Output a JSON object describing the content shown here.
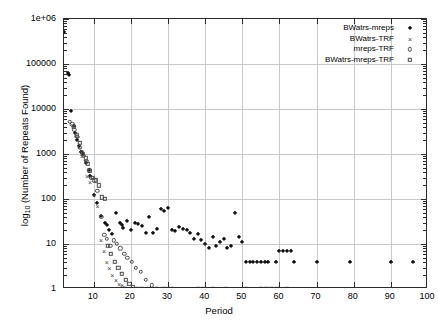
{
  "chart_data": {
    "type": "scatter",
    "title": "",
    "xlabel": "Period",
    "ylabel": "log10 (Number of Repeats Found)",
    "ylabel_base": "log",
    "ylabel_sub": "10",
    "ylabel_rest": " (Number of Repeats Found)",
    "xlim": [
      2,
      100
    ],
    "ylim": [
      1,
      1000000
    ],
    "yscale": "log",
    "xscale": "linear",
    "grid": true,
    "legend_position": "top-right-inside",
    "xticks": [
      10,
      20,
      30,
      40,
      50,
      60,
      70,
      80,
      90,
      100
    ],
    "xticklabels": [
      "10",
      "20",
      "30",
      "40",
      "50",
      "60",
      "70",
      "80",
      "90",
      "100"
    ],
    "yticks": [
      1,
      10,
      100,
      1000,
      10000,
      100000,
      1000000
    ],
    "yticklabels": [
      "1",
      "10",
      "100",
      "1000",
      "10000",
      "100000",
      "1e+06"
    ],
    "series": [
      {
        "name": "BWatrs-mreps",
        "marker": "filled-diamond",
        "color": "#111111",
        "points": [
          [
            2,
            520000
          ],
          [
            3,
            62000
          ],
          [
            3.4,
            58000
          ],
          [
            4,
            9000
          ],
          [
            4.6,
            4200
          ],
          [
            5,
            3000
          ],
          [
            5.4,
            2000
          ],
          [
            6,
            1500
          ],
          [
            6.6,
            1100
          ],
          [
            7,
            1000
          ],
          [
            8,
            620
          ],
          [
            8.6,
            430
          ],
          [
            9,
            330
          ],
          [
            10,
            120
          ],
          [
            11,
            80
          ],
          [
            12,
            42
          ],
          [
            13,
            30
          ],
          [
            13.6,
            26
          ],
          [
            14,
            20
          ],
          [
            15,
            17
          ],
          [
            16,
            48
          ],
          [
            17,
            30
          ],
          [
            17.6,
            26
          ],
          [
            18,
            23
          ],
          [
            19,
            32
          ],
          [
            20,
            20
          ],
          [
            21,
            30
          ],
          [
            22,
            28
          ],
          [
            23,
            25
          ],
          [
            24,
            18
          ],
          [
            25,
            40
          ],
          [
            26,
            18
          ],
          [
            27,
            22
          ],
          [
            28,
            60
          ],
          [
            29,
            55
          ],
          [
            30,
            62
          ],
          [
            31,
            21
          ],
          [
            32,
            19
          ],
          [
            33,
            24
          ],
          [
            34,
            22
          ],
          [
            35,
            20
          ],
          [
            36,
            18
          ],
          [
            37,
            13
          ],
          [
            38,
            17
          ],
          [
            39,
            12
          ],
          [
            40,
            10
          ],
          [
            41,
            8
          ],
          [
            42,
            14
          ],
          [
            43,
            9
          ],
          [
            44,
            11
          ],
          [
            45,
            13
          ],
          [
            46,
            8
          ],
          [
            47,
            9
          ],
          [
            48,
            50
          ],
          [
            49,
            14
          ],
          [
            50,
            11
          ],
          [
            51,
            4
          ],
          [
            52,
            4
          ],
          [
            53,
            4
          ],
          [
            54,
            4
          ],
          [
            55,
            4
          ],
          [
            56,
            4
          ],
          [
            57,
            4
          ],
          [
            59,
            4
          ],
          [
            60,
            7
          ],
          [
            61,
            7
          ],
          [
            62,
            7
          ],
          [
            63,
            7
          ],
          [
            64,
            4
          ],
          [
            70,
            4
          ],
          [
            79,
            4
          ],
          [
            90,
            4
          ],
          [
            96,
            4
          ]
        ]
      },
      {
        "name": "BWatrs-TRF",
        "marker": "cross",
        "color": "#3a3a3a",
        "points": [
          [
            4.4,
            4300
          ],
          [
            5.2,
            2600
          ],
          [
            6.1,
            1400
          ],
          [
            6.8,
            900
          ],
          [
            8.2,
            330
          ],
          [
            9.0,
            240
          ],
          [
            10.1,
            120
          ],
          [
            11.0,
            70
          ],
          [
            12.0,
            12
          ],
          [
            12.8,
            7
          ],
          [
            13.5,
            4
          ],
          [
            14.2,
            3
          ],
          [
            15.0,
            2
          ],
          [
            16.0,
            1.6
          ],
          [
            16.8,
            1.3
          ],
          [
            17.6,
            1.2
          ],
          [
            18.4,
            1.1
          ],
          [
            19.2,
            1.05
          ],
          [
            20.0,
            1
          ],
          [
            21.5,
            1
          ],
          [
            23.0,
            1
          ]
        ]
      },
      {
        "name": "mreps-TRF",
        "marker": "open-circle",
        "color": "#4a4a4a",
        "points": [
          [
            3.6,
            5200
          ],
          [
            4.2,
            4600
          ],
          [
            4.8,
            3400
          ],
          [
            5.6,
            2400
          ],
          [
            6.2,
            1400
          ],
          [
            6.8,
            1100
          ],
          [
            7.4,
            900
          ],
          [
            8.0,
            700
          ],
          [
            8.8,
            430
          ],
          [
            9.4,
            300
          ],
          [
            10.2,
            260
          ],
          [
            11.0,
            150
          ],
          [
            12.0,
            40
          ],
          [
            12.8,
            16
          ],
          [
            13.6,
            13
          ],
          [
            14.5,
            9
          ],
          [
            15.4,
            12
          ],
          [
            16.2,
            10
          ],
          [
            17.2,
            8
          ],
          [
            18.2,
            6
          ],
          [
            19.0,
            5
          ],
          [
            20.2,
            4
          ],
          [
            21.4,
            3
          ],
          [
            22.6,
            2.4
          ],
          [
            24.0,
            1.6
          ],
          [
            25.6,
            1.2
          ],
          [
            27.0,
            1
          ]
        ]
      },
      {
        "name": "BWatrs-mreps-TRF",
        "marker": "open-square",
        "color": "#4a4a4a",
        "points": [
          [
            4.6,
            4000
          ],
          [
            5.4,
            2600
          ],
          [
            6.2,
            1800
          ],
          [
            7.0,
            1000
          ],
          [
            7.8,
            800
          ],
          [
            8.4,
            600
          ],
          [
            9.0,
            420
          ],
          [
            9.8,
            300
          ],
          [
            10.6,
            260
          ],
          [
            11.4,
            200
          ],
          [
            12.2,
            110
          ],
          [
            13.0,
            100
          ],
          [
            13.8,
            9
          ],
          [
            14.6,
            6
          ],
          [
            15.6,
            4
          ],
          [
            16.6,
            3
          ],
          [
            17.6,
            2.2
          ],
          [
            18.6,
            1.6
          ],
          [
            19.6,
            1.3
          ],
          [
            20.6,
            1.1
          ],
          [
            21.6,
            1
          ],
          [
            23.0,
            1
          ],
          [
            25.0,
            1
          ],
          [
            27.0,
            1
          ],
          [
            29.0,
            1
          ],
          [
            31.0,
            1
          ],
          [
            38.0,
            1
          ],
          [
            39.5,
            1
          ],
          [
            42.0,
            1
          ],
          [
            45.5,
            1
          ],
          [
            51.0,
            1
          ],
          [
            55.0,
            1
          ],
          [
            56.5,
            1
          ],
          [
            58.0,
            1
          ],
          [
            59.5,
            1
          ],
          [
            62.0,
            1
          ]
        ]
      }
    ]
  }
}
